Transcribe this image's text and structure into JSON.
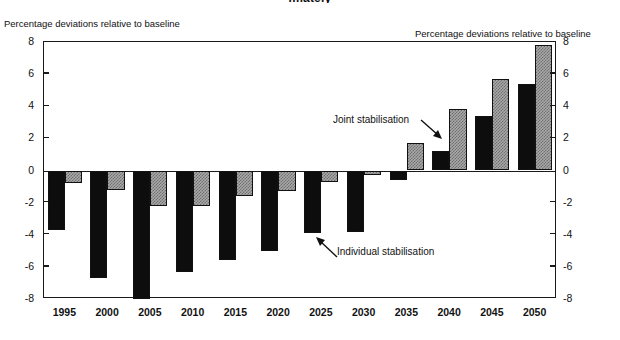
{
  "title": "imately",
  "axis_caption_left": "Percentage deviations relative to baseline",
  "axis_caption_right": "Percentage deviations relative to baseline",
  "annotations": {
    "joint": "Joint stabilisation",
    "individual": "Individual stabilisation"
  },
  "chart_data": {
    "type": "bar",
    "title": "",
    "xlabel": "",
    "ylabel": "Percentage deviations relative to baseline",
    "ylim": [
      -8,
      8
    ],
    "yticks": [
      8,
      6,
      4,
      2,
      0,
      -2,
      -4,
      -6,
      -8
    ],
    "ytick_labels_left": [
      "8",
      "6",
      "4",
      "2",
      "0",
      "-2",
      "-4",
      "-6",
      "-8"
    ],
    "ytick_labels_right": [
      "8",
      "6",
      "4",
      "2",
      "0",
      "-2",
      "-4",
      "-6",
      "-8"
    ],
    "grid": false,
    "legend_position": "annotation",
    "categories": [
      "1995",
      "2000",
      "2005",
      "2010",
      "2015",
      "2020",
      "2025",
      "2030",
      "2035",
      "2040",
      "2045",
      "2050"
    ],
    "series": [
      {
        "name": "Individual stabilisation",
        "color": "#0d0d0d",
        "values": [
          -3.7,
          -6.7,
          -8.0,
          -6.3,
          -5.6,
          -5.0,
          -3.9,
          -3.8,
          -0.6,
          1.2,
          3.4,
          5.4
        ]
      },
      {
        "name": "Joint stabilisation",
        "color": "#a9a9a9",
        "values": [
          -0.75,
          -1.2,
          -2.2,
          -2.2,
          -1.6,
          -1.3,
          -0.7,
          -0.3,
          1.7,
          3.8,
          5.7,
          7.8
        ]
      }
    ]
  }
}
